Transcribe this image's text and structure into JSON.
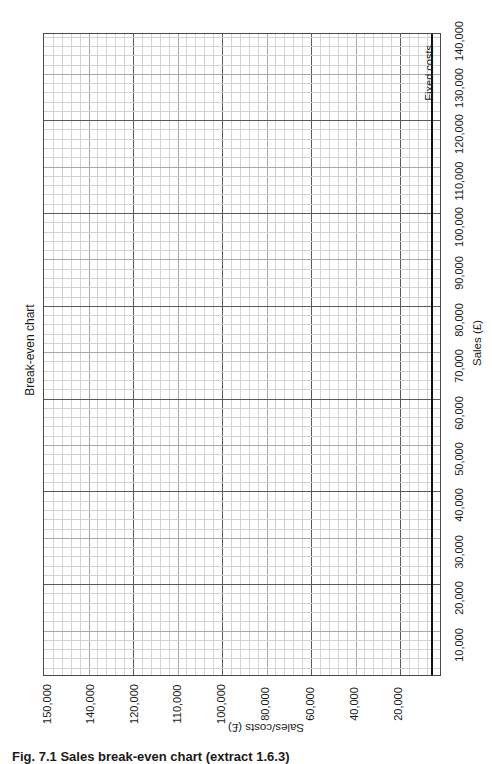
{
  "chart_data": {
    "type": "line",
    "title": "Break-even chart",
    "orientation": "rotated 90° (page printed sideways)",
    "xlabel": "Sales (£)",
    "ylabel": "Sales/costs (£)",
    "x_ticks": [
      "10,000",
      "20,000",
      "30,000",
      "40,000",
      "50,000",
      "60,000",
      "70,000",
      "80,000",
      "90,000",
      "100,000",
      "110,000",
      "120,000",
      "130,000",
      "140,000"
    ],
    "y_ticks": [
      "150,000",
      "140,000",
      "120,000",
      "110,000",
      "100,000",
      "80,000",
      "60,000",
      "40,000",
      "20,000"
    ],
    "xlim": [
      0,
      140000
    ],
    "ylim": [
      0,
      150000
    ],
    "grid": true,
    "series": [
      {
        "name": "Fixed costs",
        "values": "horizontal line just above zero (unlabelled value)"
      }
    ],
    "annotations": [
      "Fixed costs"
    ],
    "legend": "none"
  },
  "caption": "Fig. 7.1 Sales break-even chart (extract 1.6.3)",
  "labels": {
    "title": "Break-even chart",
    "xlabel": "Sales (£)",
    "ylabel": "Sales/costs (£)",
    "fixed": "Fixed costs"
  }
}
